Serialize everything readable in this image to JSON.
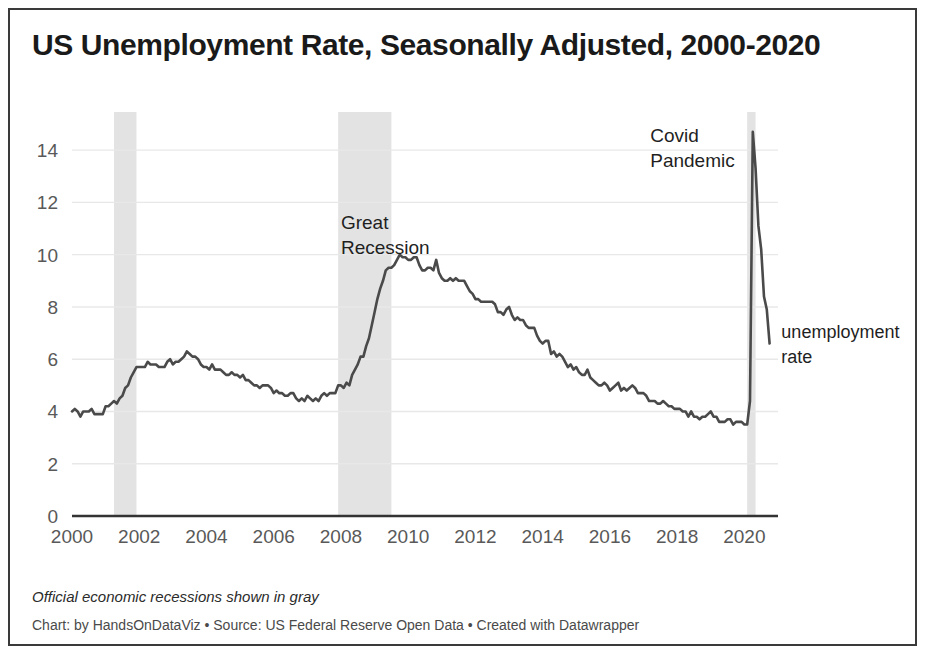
{
  "header": {
    "title": "US Unemployment Rate, Seasonally Adjusted, 2000-2020"
  },
  "footer": {
    "note": "Official economic recessions shown in gray",
    "credit": "Chart: by HandsOnDataViz • Source: US Federal Reserve Open Data • Created with Datawrapper"
  },
  "colors": {
    "line": "#4a4a4a",
    "recession_band": "#e3e3e3",
    "gridline": "#e8e8e8",
    "axis": "#333333",
    "tick_label": "#595959",
    "title": "#1a1a1a",
    "background": "#ffffff",
    "border": "#3a3a3a"
  },
  "chart_data": {
    "type": "line",
    "title": "US Unemployment Rate, Seasonally Adjusted, 2000-2020",
    "xlabel": "",
    "ylabel": "",
    "xlim": [
      2000,
      2021
    ],
    "ylim": [
      0,
      15
    ],
    "grid": true,
    "legend_position": "right-inline",
    "y_ticks": [
      0,
      2,
      4,
      6,
      8,
      10,
      12,
      14
    ],
    "x_ticks": [
      2000,
      2002,
      2004,
      2006,
      2008,
      2010,
      2012,
      2014,
      2016,
      2018,
      2020
    ],
    "series": [
      {
        "name": "unemployment rate",
        "color": "#4a4a4a",
        "x": [
          2000.0,
          2000.083,
          2000.167,
          2000.25,
          2000.333,
          2000.417,
          2000.5,
          2000.583,
          2000.667,
          2000.75,
          2000.833,
          2000.917,
          2001.0,
          2001.083,
          2001.167,
          2001.25,
          2001.333,
          2001.417,
          2001.5,
          2001.583,
          2001.667,
          2001.75,
          2001.833,
          2001.917,
          2002.0,
          2002.083,
          2002.167,
          2002.25,
          2002.333,
          2002.417,
          2002.5,
          2002.583,
          2002.667,
          2002.75,
          2002.833,
          2002.917,
          2003.0,
          2003.083,
          2003.167,
          2003.25,
          2003.333,
          2003.417,
          2003.5,
          2003.583,
          2003.667,
          2003.75,
          2003.833,
          2003.917,
          2004.0,
          2004.083,
          2004.167,
          2004.25,
          2004.333,
          2004.417,
          2004.5,
          2004.583,
          2004.667,
          2004.75,
          2004.833,
          2004.917,
          2005.0,
          2005.083,
          2005.167,
          2005.25,
          2005.333,
          2005.417,
          2005.5,
          2005.583,
          2005.667,
          2005.75,
          2005.833,
          2005.917,
          2006.0,
          2006.083,
          2006.167,
          2006.25,
          2006.333,
          2006.417,
          2006.5,
          2006.583,
          2006.667,
          2006.75,
          2006.833,
          2006.917,
          2007.0,
          2007.083,
          2007.167,
          2007.25,
          2007.333,
          2007.417,
          2007.5,
          2007.583,
          2007.667,
          2007.75,
          2007.833,
          2007.917,
          2008.0,
          2008.083,
          2008.167,
          2008.25,
          2008.333,
          2008.417,
          2008.5,
          2008.583,
          2008.667,
          2008.75,
          2008.833,
          2008.917,
          2009.0,
          2009.083,
          2009.167,
          2009.25,
          2009.333,
          2009.417,
          2009.5,
          2009.583,
          2009.667,
          2009.75,
          2009.833,
          2009.917,
          2010.0,
          2010.083,
          2010.167,
          2010.25,
          2010.333,
          2010.417,
          2010.5,
          2010.583,
          2010.667,
          2010.75,
          2010.833,
          2010.917,
          2011.0,
          2011.083,
          2011.167,
          2011.25,
          2011.333,
          2011.417,
          2011.5,
          2011.583,
          2011.667,
          2011.75,
          2011.833,
          2011.917,
          2012.0,
          2012.083,
          2012.167,
          2012.25,
          2012.333,
          2012.417,
          2012.5,
          2012.583,
          2012.667,
          2012.75,
          2012.833,
          2012.917,
          2013.0,
          2013.083,
          2013.167,
          2013.25,
          2013.333,
          2013.417,
          2013.5,
          2013.583,
          2013.667,
          2013.75,
          2013.833,
          2013.917,
          2014.0,
          2014.083,
          2014.167,
          2014.25,
          2014.333,
          2014.417,
          2014.5,
          2014.583,
          2014.667,
          2014.75,
          2014.833,
          2014.917,
          2015.0,
          2015.083,
          2015.167,
          2015.25,
          2015.333,
          2015.417,
          2015.5,
          2015.583,
          2015.667,
          2015.75,
          2015.833,
          2015.917,
          2016.0,
          2016.083,
          2016.167,
          2016.25,
          2016.333,
          2016.417,
          2016.5,
          2016.583,
          2016.667,
          2016.75,
          2016.833,
          2016.917,
          2017.0,
          2017.083,
          2017.167,
          2017.25,
          2017.333,
          2017.417,
          2017.5,
          2017.583,
          2017.667,
          2017.75,
          2017.833,
          2017.917,
          2018.0,
          2018.083,
          2018.167,
          2018.25,
          2018.333,
          2018.417,
          2018.5,
          2018.583,
          2018.667,
          2018.75,
          2018.833,
          2018.917,
          2019.0,
          2019.083,
          2019.167,
          2019.25,
          2019.333,
          2019.417,
          2019.5,
          2019.583,
          2019.667,
          2019.75,
          2019.833,
          2019.917,
          2020.0,
          2020.083,
          2020.167,
          2020.25,
          2020.333,
          2020.417,
          2020.5,
          2020.583,
          2020.667,
          2020.75
        ],
        "values": [
          4.0,
          4.1,
          4.0,
          3.8,
          4.0,
          4.0,
          4.0,
          4.1,
          3.9,
          3.9,
          3.9,
          3.9,
          4.2,
          4.2,
          4.3,
          4.4,
          4.3,
          4.5,
          4.6,
          4.9,
          5.0,
          5.3,
          5.5,
          5.7,
          5.7,
          5.7,
          5.7,
          5.9,
          5.8,
          5.8,
          5.8,
          5.7,
          5.7,
          5.7,
          5.9,
          6.0,
          5.8,
          5.9,
          5.9,
          6.0,
          6.1,
          6.3,
          6.2,
          6.1,
          6.1,
          6.0,
          5.8,
          5.7,
          5.7,
          5.6,
          5.8,
          5.6,
          5.6,
          5.6,
          5.5,
          5.4,
          5.4,
          5.5,
          5.4,
          5.4,
          5.3,
          5.4,
          5.2,
          5.2,
          5.1,
          5.0,
          5.0,
          4.9,
          5.0,
          5.0,
          5.0,
          4.9,
          4.7,
          4.8,
          4.7,
          4.7,
          4.6,
          4.6,
          4.7,
          4.7,
          4.5,
          4.4,
          4.5,
          4.4,
          4.6,
          4.5,
          4.4,
          4.5,
          4.4,
          4.6,
          4.7,
          4.6,
          4.7,
          4.7,
          4.7,
          5.0,
          5.0,
          4.9,
          5.1,
          5.0,
          5.4,
          5.6,
          5.8,
          6.1,
          6.1,
          6.5,
          6.8,
          7.3,
          7.8,
          8.3,
          8.7,
          9.0,
          9.4,
          9.5,
          9.5,
          9.6,
          9.8,
          10.0,
          9.9,
          9.9,
          9.8,
          9.8,
          9.9,
          9.9,
          9.6,
          9.4,
          9.4,
          9.5,
          9.5,
          9.4,
          9.8,
          9.3,
          9.1,
          9.0,
          9.0,
          9.1,
          9.0,
          9.1,
          9.0,
          9.0,
          9.0,
          8.8,
          8.6,
          8.5,
          8.3,
          8.3,
          8.2,
          8.2,
          8.2,
          8.2,
          8.2,
          8.1,
          7.8,
          7.8,
          7.7,
          7.9,
          8.0,
          7.7,
          7.5,
          7.6,
          7.5,
          7.5,
          7.3,
          7.2,
          7.2,
          7.2,
          6.9,
          6.7,
          6.6,
          6.7,
          6.7,
          6.2,
          6.3,
          6.1,
          6.2,
          6.1,
          5.9,
          5.7,
          5.8,
          5.6,
          5.7,
          5.5,
          5.4,
          5.4,
          5.6,
          5.3,
          5.2,
          5.1,
          5.0,
          5.0,
          5.1,
          5.0,
          4.8,
          4.9,
          5.0,
          5.1,
          4.8,
          4.9,
          4.8,
          4.9,
          5.0,
          4.9,
          4.7,
          4.7,
          4.7,
          4.6,
          4.4,
          4.4,
          4.4,
          4.3,
          4.3,
          4.4,
          4.3,
          4.2,
          4.2,
          4.1,
          4.1,
          4.1,
          4.0,
          4.0,
          3.8,
          4.0,
          3.8,
          3.8,
          3.7,
          3.8,
          3.8,
          3.9,
          4.0,
          3.8,
          3.8,
          3.6,
          3.6,
          3.6,
          3.7,
          3.7,
          3.5,
          3.6,
          3.6,
          3.6,
          3.5,
          3.5,
          4.4,
          14.7,
          13.3,
          11.1,
          10.2,
          8.4,
          7.9,
          6.6
        ]
      }
    ],
    "recession_bands": [
      {
        "label": "2001 recession",
        "start": 2001.25,
        "end": 2001.917
      },
      {
        "label": "Great Recession",
        "start": 2007.917,
        "end": 2009.5
      },
      {
        "label": "Covid recession",
        "start": 2020.083,
        "end": 2020.333
      }
    ],
    "annotations": [
      {
        "name": "great-recession",
        "text_lines": [
          "Great",
          "Recession"
        ],
        "x": 2008.0,
        "y": 11.0
      },
      {
        "name": "covid-pandemic",
        "text_lines": [
          "Covid",
          "Pandemic"
        ],
        "x": 2017.2,
        "y": 14.3
      },
      {
        "name": "series-label",
        "text_lines": [
          "unemployment",
          "rate"
        ],
        "x": 2021.1,
        "y": 6.8
      }
    ]
  }
}
